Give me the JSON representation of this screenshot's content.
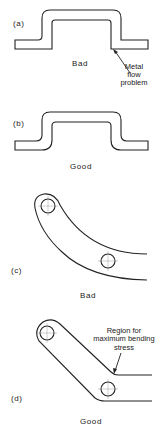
{
  "figure": {
    "panels": [
      {
        "id": "a",
        "label": "(a)",
        "verdict": "Bad",
        "annotation": [
          "Metal",
          "flow",
          "problem"
        ]
      },
      {
        "id": "b",
        "label": "(b)",
        "verdict": "Good"
      },
      {
        "id": "c",
        "label": "(c)",
        "verdict": "Bad"
      },
      {
        "id": "d",
        "label": "(d)",
        "verdict": "Good",
        "annotation": [
          "Region for",
          "maximum bending",
          "stress"
        ]
      }
    ]
  }
}
